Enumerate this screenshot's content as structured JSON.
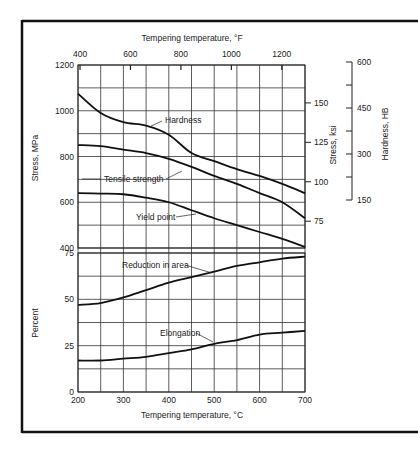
{
  "chart_data": {
    "type": "line",
    "title": "",
    "xlabel": "Tempering temperature, °C",
    "x_top_label": "Tempering temperature, °F",
    "x": [
      200,
      250,
      300,
      350,
      400,
      450,
      500,
      550,
      600,
      650,
      700
    ],
    "xlim": [
      200,
      700
    ],
    "x_ticks": [
      200,
      300,
      400,
      500,
      600,
      700
    ],
    "x_top_ticks": [
      400,
      600,
      800,
      1000,
      1200
    ],
    "grid": true,
    "panels": [
      {
        "name": "stress",
        "ylabel": "Stress, MPa",
        "ylim": [
          400,
          1200
        ],
        "y_ticks": [
          400,
          600,
          800,
          1000,
          1200
        ],
        "secondary_axes": [
          {
            "label": "Stress, ksi",
            "ticks": [
              75,
              100,
              125,
              150
            ]
          },
          {
            "label": "Hardness, HB",
            "ticks": [
              150,
              300,
              450,
              600
            ]
          }
        ],
        "series": [
          {
            "name": "Hardness",
            "values": [
              1075,
              990,
              950,
              935,
              895,
              815,
              780,
              745,
              715,
              680,
              640
            ]
          },
          {
            "name": "Tensile strength",
            "values": [
              850,
              845,
              830,
              815,
              790,
              755,
              715,
              680,
              640,
              600,
              530
            ]
          },
          {
            "name": "Yield point",
            "values": [
              640,
              638,
              635,
              620,
              600,
              565,
              530,
              500,
              470,
              440,
              405
            ]
          }
        ]
      },
      {
        "name": "percent",
        "ylabel": "Percent",
        "ylim": [
          0,
          75
        ],
        "y_ticks": [
          0,
          25,
          50,
          75
        ],
        "series": [
          {
            "name": "Reduction in area",
            "values": [
              47,
              48,
              51,
              55,
              59,
              62,
              65,
              68,
              70,
              72,
              73
            ]
          },
          {
            "name": "Elongation",
            "values": [
              17,
              17,
              18,
              19,
              21,
              23,
              26,
              28,
              31,
              32,
              33
            ]
          }
        ]
      }
    ],
    "annotations": [
      "Hardness",
      "Tensile strength",
      "Yield point",
      "Reduction in area",
      "Elongation"
    ]
  },
  "labels": {
    "top_axis_title": "Tempering temperature, °F",
    "bottom_axis_title": "Tempering temperature, °C",
    "stress_mpa": "Stress, MPa",
    "stress_ksi": "Stress, ksi",
    "hardness_hb": "Hardness, HB",
    "percent": "Percent",
    "hardness": "Hardness",
    "tensile": "Tensile strength",
    "yield": "Yield point",
    "reduction": "Reduction in area",
    "elongation": "Elongation"
  }
}
